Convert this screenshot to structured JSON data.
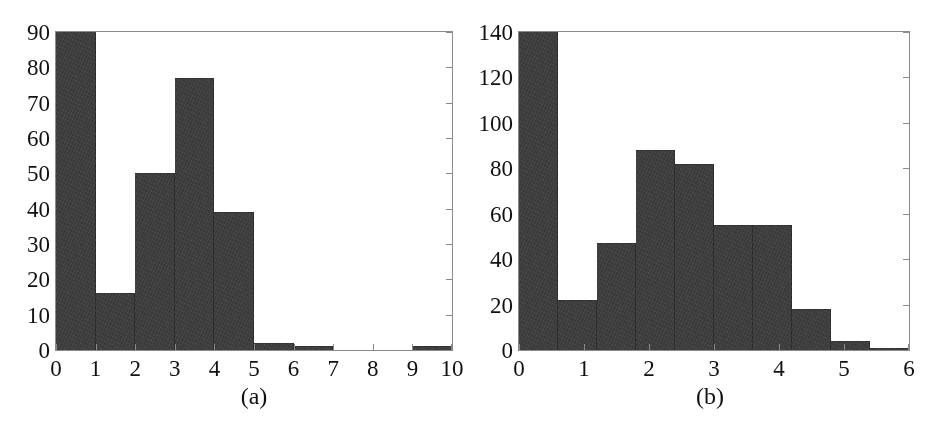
{
  "figure": {
    "background": "#ffffff",
    "bar_color": "#3b3b3b",
    "axis_color": "#8a8a8a",
    "text_color": "#111111"
  },
  "panels": [
    {
      "id": "panel-a",
      "caption": "(a)",
      "chart_data": {
        "type": "bar",
        "title": "",
        "xlabel": "",
        "ylabel": "",
        "xlim": [
          0,
          10
        ],
        "ylim": [
          0,
          90
        ],
        "grid": false,
        "legend": "none",
        "bin_width": 1,
        "bin_edges": [
          0,
          1,
          2,
          3,
          4,
          5,
          6,
          7,
          8,
          9,
          10
        ],
        "categories": [
          "0-1",
          "1-2",
          "2-3",
          "3-4",
          "4-5",
          "5-6",
          "6-7",
          "7-8",
          "8-9",
          "9-10"
        ],
        "values": [
          92,
          16,
          50,
          77,
          39,
          2,
          1,
          0,
          0,
          1
        ],
        "clipped_bars": [
          0
        ],
        "xticks": [
          "0",
          "1",
          "2",
          "3",
          "4",
          "5",
          "6",
          "7",
          "8",
          "9",
          "10"
        ],
        "xtick_values": [
          0,
          1,
          2,
          3,
          4,
          5,
          6,
          7,
          8,
          9,
          10
        ],
        "yticks": [
          "0",
          "10",
          "20",
          "30",
          "40",
          "50",
          "60",
          "70",
          "80",
          "90"
        ],
        "ytick_values": [
          0,
          10,
          20,
          30,
          40,
          50,
          60,
          70,
          80,
          90
        ]
      }
    },
    {
      "id": "panel-b",
      "caption": "(b)",
      "chart_data": {
        "type": "bar",
        "title": "",
        "xlabel": "",
        "ylabel": "",
        "xlim": [
          0,
          6
        ],
        "ylim": [
          0,
          140
        ],
        "grid": false,
        "legend": "none",
        "bin_width": 0.6,
        "bin_edges": [
          0,
          0.6,
          1.2,
          1.8,
          2.4,
          3.0,
          3.6,
          4.2,
          4.8,
          5.4,
          6.0
        ],
        "categories": [
          "0-0.6",
          "0.6-1.2",
          "1.2-1.8",
          "1.8-2.4",
          "2.4-3.0",
          "3.0-3.6",
          "3.6-4.2",
          "4.2-4.8",
          "4.8-5.4",
          "5.4-6.0"
        ],
        "values": [
          143,
          22,
          47,
          88,
          82,
          55,
          55,
          18,
          4,
          1
        ],
        "clipped_bars": [
          0
        ],
        "xticks": [
          "0",
          "1",
          "2",
          "3",
          "4",
          "5",
          "6"
        ],
        "xtick_values": [
          0,
          1,
          2,
          3,
          4,
          5,
          6
        ],
        "yticks": [
          "0",
          "20",
          "40",
          "60",
          "80",
          "100",
          "120",
          "140"
        ],
        "ytick_values": [
          0,
          20,
          40,
          60,
          80,
          100,
          120,
          140
        ]
      }
    }
  ]
}
